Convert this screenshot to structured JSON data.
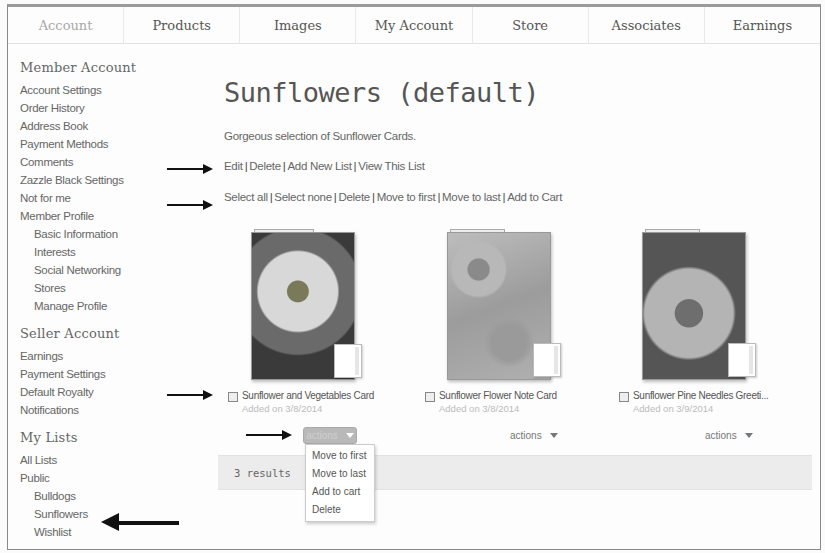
{
  "topnav": {
    "tabs": [
      {
        "label": "Account",
        "active": true
      },
      {
        "label": "Products",
        "active": false
      },
      {
        "label": "Images",
        "active": false
      },
      {
        "label": "My Account",
        "active": false
      },
      {
        "label": "Store",
        "active": false
      },
      {
        "label": "Associates",
        "active": false
      },
      {
        "label": "Earnings",
        "active": false
      }
    ]
  },
  "sidebar": {
    "member_account": {
      "title": "Member Account",
      "items": [
        "Account Settings",
        "Order History",
        "Address Book",
        "Payment Methods",
        "Comments",
        "Zazzle Black Settings",
        "Not for me",
        "Member Profile"
      ],
      "profile_subitems": [
        "Basic Information",
        "Interests",
        "Social Networking",
        "Stores",
        "Manage Profile"
      ]
    },
    "seller_account": {
      "title": "Seller Account",
      "items": [
        "Earnings",
        "Payment Settings",
        "Default Royalty",
        "Notifications"
      ]
    },
    "my_lists": {
      "title": "My Lists",
      "items": [
        "All Lists",
        "Public"
      ],
      "public_subitems": [
        "Bulldogs",
        "Sunflowers",
        "Wishlist"
      ]
    }
  },
  "main": {
    "title": "Sunflowers (default)",
    "description": "Gorgeous selection of Sunflower Cards.",
    "list_actions": [
      "Edit",
      "Delete",
      "Add New List",
      "View This List"
    ],
    "selection_actions": [
      "Select all",
      "Select none",
      "Delete",
      "Move to first",
      "Move to last",
      "Add to Cart"
    ],
    "separator": "|",
    "products": [
      {
        "name": "Sunflower and Vegetables Card",
        "date": "Added on 3/8/2014",
        "checked": false
      },
      {
        "name": "Sunflower Flower Note Card",
        "date": "Added on 3/8/2014",
        "checked": false
      },
      {
        "name": "Sunflower Pine Needles Greeti...",
        "date": "Added on 3/9/2014",
        "checked": false
      }
    ],
    "actions_label": "actions",
    "actions_menu": [
      "Move to first",
      "Move to last",
      "Add to cart",
      "Delete"
    ],
    "results": "3 results"
  }
}
